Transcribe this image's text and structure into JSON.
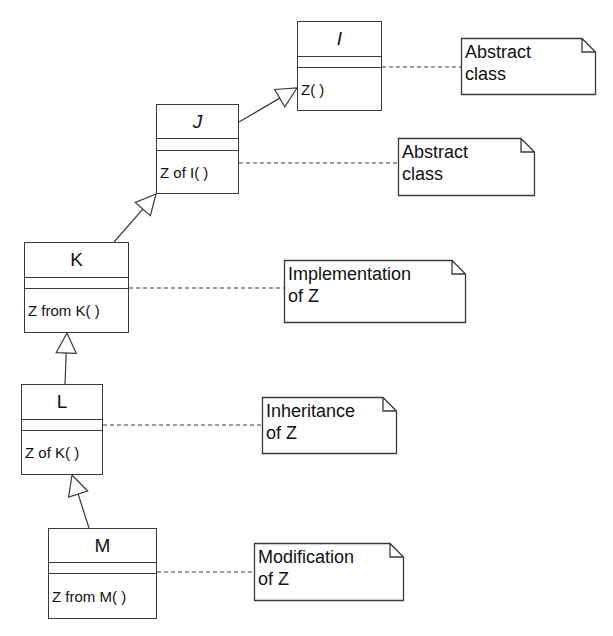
{
  "diagram": {
    "type": "uml-class-inheritance",
    "line_color": "#3a3a3a",
    "classes": [
      {
        "id": "I",
        "name": "I",
        "italic": true,
        "operation": "Z( )",
        "x": 297,
        "y": 21,
        "w": 85,
        "h": 90,
        "name_h": 35,
        "attrs_h": 11
      },
      {
        "id": "J",
        "name": "J",
        "italic": true,
        "operation": "Z of I( )",
        "x": 156,
        "y": 104,
        "w": 83,
        "h": 90,
        "name_h": 34,
        "attrs_h": 12
      },
      {
        "id": "K",
        "name": "K",
        "italic": false,
        "operation": "Z from K( )",
        "x": 24,
        "y": 242,
        "w": 105,
        "h": 91,
        "name_h": 35,
        "attrs_h": 11
      },
      {
        "id": "L",
        "name": "L",
        "italic": false,
        "operation": "Z of K( )",
        "x": 21,
        "y": 384,
        "w": 82,
        "h": 91,
        "name_h": 35,
        "attrs_h": 11
      },
      {
        "id": "M",
        "name": "M",
        "italic": false,
        "operation": "Z from M( )",
        "x": 48,
        "y": 528,
        "w": 109,
        "h": 91,
        "name_h": 34,
        "attrs_h": 11
      }
    ],
    "notes": [
      {
        "id": "note-I",
        "lines": "Abstract\nclass",
        "x": 461,
        "y": 38,
        "w": 135,
        "h": 57,
        "attached_to": "I",
        "anchor_y": 67
      },
      {
        "id": "note-J",
        "lines": "Abstract\nclass",
        "x": 398,
        "y": 138,
        "w": 137,
        "h": 58,
        "attached_to": "J",
        "anchor_y": 163
      },
      {
        "id": "note-K",
        "lines": "Implementation\nof Z",
        "x": 284,
        "y": 260,
        "w": 182,
        "h": 63,
        "attached_to": "K",
        "anchor_y": 288
      },
      {
        "id": "note-L",
        "lines": "Inheritance\nof Z",
        "x": 262,
        "y": 397,
        "w": 135,
        "h": 57,
        "attached_to": "L",
        "anchor_y": 425
      },
      {
        "id": "note-M",
        "lines": "Modification\nof Z",
        "x": 254,
        "y": 543,
        "w": 150,
        "h": 58,
        "attached_to": "M",
        "anchor_y": 572
      }
    ],
    "generalizations": [
      {
        "from": "J",
        "to": "I",
        "start": [
          239,
          122
        ],
        "tip": [
          297,
          88
        ]
      },
      {
        "from": "K",
        "to": "J",
        "start": [
          114,
          242
        ],
        "tip": [
          156,
          194
        ]
      },
      {
        "from": "L",
        "to": "K",
        "start": [
          65,
          384
        ],
        "tip": [
          67,
          333
        ]
      },
      {
        "from": "M",
        "to": "L",
        "start": [
          89,
          528
        ],
        "tip": [
          72,
          475
        ]
      }
    ]
  }
}
